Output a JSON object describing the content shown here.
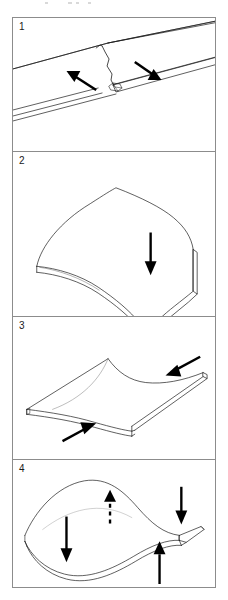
{
  "figure": {
    "panel_count": 4,
    "colors": {
      "frame_border": "#8c8c8c",
      "outline": "#1a1a1a",
      "arrow_fill": "#000000",
      "background": "#ffffff"
    }
  },
  "panels": [
    {
      "number": "1",
      "caption": "",
      "subject": "flat-sheet-with-tear",
      "arrows": [
        {
          "name": "arrow-left",
          "direction": "left-down",
          "style": "solid",
          "label": ""
        },
        {
          "name": "arrow-right",
          "direction": "right-down",
          "style": "solid",
          "label": ""
        }
      ]
    },
    {
      "number": "2",
      "caption": "",
      "subject": "sheet-folded-single-crease",
      "arrows": [
        {
          "name": "arrow-down",
          "direction": "down",
          "style": "solid",
          "label": ""
        }
      ]
    },
    {
      "number": "3",
      "caption": "",
      "subject": "saddle-shaped-sheet",
      "arrows": [
        {
          "name": "arrow-upper-right",
          "direction": "down-left",
          "style": "solid",
          "label": ""
        },
        {
          "name": "arrow-lower-left",
          "direction": "up-right",
          "style": "solid",
          "label": ""
        }
      ]
    },
    {
      "number": "4",
      "caption": "",
      "subject": "wave-buckled-sheet",
      "arrows": [
        {
          "name": "arrow-center-up-dashed",
          "direction": "up",
          "style": "dashed",
          "label": ""
        },
        {
          "name": "arrow-left-down",
          "direction": "down",
          "style": "solid",
          "label": ""
        },
        {
          "name": "arrow-right-down",
          "direction": "down",
          "style": "solid",
          "label": ""
        },
        {
          "name": "arrow-bottom-up",
          "direction": "up",
          "style": "solid",
          "label": ""
        }
      ]
    }
  ]
}
